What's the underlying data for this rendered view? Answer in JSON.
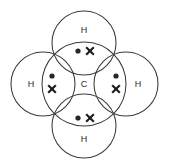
{
  "diagram": {
    "molecule": "CH4",
    "background_color": "#ffffff",
    "stroke_color": "#3a3a3a",
    "electron_dot_color": "#262626",
    "electron_cross_color": "#1a1a1a",
    "central_atom": {
      "symbol": "C",
      "name": "carbon",
      "cx": 84,
      "cy": 84,
      "r": 42
    },
    "outer_atoms": [
      {
        "id": "hydrogen-top",
        "symbol": "H",
        "position": "top",
        "cx": 84,
        "cy": 43,
        "r": 32,
        "label_x": 84,
        "label_y": 30
      },
      {
        "id": "hydrogen-left",
        "symbol": "H",
        "position": "left",
        "cx": 43,
        "cy": 84,
        "r": 32,
        "label_x": 31,
        "label_y": 84
      },
      {
        "id": "hydrogen-right",
        "symbol": "H",
        "position": "right",
        "cx": 126,
        "cy": 84,
        "r": 32,
        "label_x": 138,
        "label_y": 84
      },
      {
        "id": "hydrogen-bottom",
        "symbol": "H",
        "position": "bottom",
        "cx": 84,
        "cy": 126,
        "r": 32,
        "label_x": 84,
        "label_y": 139
      }
    ],
    "bonding_pairs": [
      {
        "id": "bond-pair-top",
        "between": "C-H top",
        "orientation": "horizontal",
        "dot": {
          "cx": 78,
          "cy": 51,
          "r": 2.6
        },
        "cross": {
          "cx": 90,
          "cy": 51,
          "size": 4.2
        }
      },
      {
        "id": "bond-pair-left",
        "between": "C-H left",
        "orientation": "vertical",
        "dot": {
          "cx": 52,
          "cy": 76,
          "r": 2.6
        },
        "cross": {
          "cx": 52,
          "cy": 89,
          "size": 4.2
        }
      },
      {
        "id": "bond-pair-right",
        "between": "C-H right",
        "orientation": "vertical",
        "dot": {
          "cx": 116,
          "cy": 76,
          "r": 2.6
        },
        "cross": {
          "cx": 116,
          "cy": 89,
          "size": 4.2
        }
      },
      {
        "id": "bond-pair-bottom",
        "between": "C-H bottom",
        "orientation": "horizontal",
        "dot": {
          "cx": 78,
          "cy": 118,
          "r": 2.6
        },
        "cross": {
          "cx": 90,
          "cy": 118,
          "size": 4.2
        }
      }
    ]
  }
}
